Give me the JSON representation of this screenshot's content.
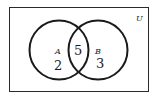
{
  "diagram": {
    "type": "venn",
    "universe_label": "U",
    "sets": [
      {
        "label": "A",
        "only_count": "2"
      },
      {
        "label": "B",
        "only_count": "3"
      }
    ],
    "intersection_count": "5",
    "colors": {
      "stroke": "#1a1a1a",
      "background": "#ffffff"
    }
  }
}
